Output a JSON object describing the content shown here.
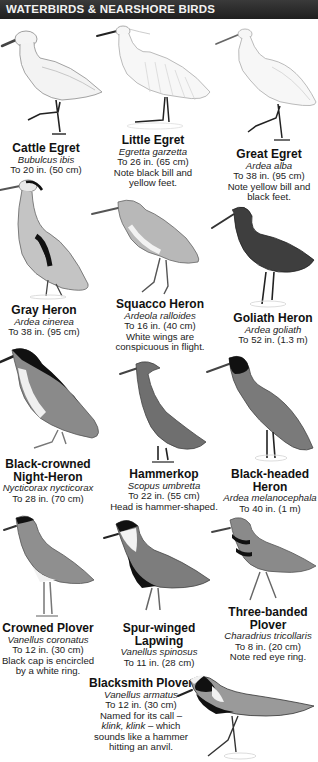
{
  "header": {
    "title": "WATERBIRDS & NEARSHORE BIRDS",
    "background": "#262626",
    "text_color": "#f2f2f2"
  },
  "birds": [
    {
      "common": "Cattle Egret",
      "scientific": "Bubulcus ibis",
      "size": "To 20 in. (50 cm)",
      "note": ""
    },
    {
      "common": "Little Egret",
      "scientific": "Egretta garzetta",
      "size": "To 26 in. (65 cm)",
      "note": "Note black bill and yellow feet."
    },
    {
      "common": "Great Egret",
      "scientific": "Ardea alba",
      "size": "To 38 in. (95 cm)",
      "note": "Note yellow bill and black feet."
    },
    {
      "common": "Gray Heron",
      "scientific": "Ardea cinerea",
      "size": "To 38 in. (95 cm)",
      "note": ""
    },
    {
      "common": "Squacco Heron",
      "scientific": "Ardeola ralloides",
      "size": "To 16 in. (40 cm)",
      "note": "White wings are conspicuous in flight."
    },
    {
      "common": "Goliath Heron",
      "scientific": "Ardea goliath",
      "size": "To 52 in. (1.3 m)",
      "note": ""
    },
    {
      "common": "Black-crowned Night-Heron",
      "scientific": "Nycticorax nycticorax",
      "size": "To 28 in. (70 cm)",
      "note": ""
    },
    {
      "common": "Hammerkop",
      "scientific": "Scopus umbretta",
      "size": "To 22 in. (55 cm)",
      "note": "Head is hammer-shaped."
    },
    {
      "common": "Black-headed Heron",
      "scientific": "Ardea melanocephala",
      "size": "To 40 in. (1 m)",
      "note": ""
    },
    {
      "common": "Crowned Plover",
      "scientific": "Vanellus coronatus",
      "size": "To 12 in. (30 cm)",
      "note": "Black cap is encircled by a white ring."
    },
    {
      "common": "Spur-winged Lapwing",
      "scientific": "Vanellus spinosus",
      "size": "To 11 in. (28 cm)",
      "note": ""
    },
    {
      "common": "Three-banded Plover",
      "scientific": "Charadrius tricollaris",
      "size": "To 8 in. (20 cm)",
      "note": "Note red eye ring."
    },
    {
      "common": "Blacksmith Plover",
      "scientific": "Vanellus armatus",
      "size": "To 12 in. (30 cm)",
      "note_before": "Named for its call – ",
      "note_call_1": "klink,",
      "note_call_2": "klink",
      "note_after": " – which sounds like a hammer hitting an anvil."
    }
  ],
  "illustrations": [
    {
      "icon": "cattle-egret-illustration"
    },
    {
      "icon": "little-egret-illustration"
    },
    {
      "icon": "great-egret-illustration"
    },
    {
      "icon": "gray-heron-illustration"
    },
    {
      "icon": "squacco-heron-illustration"
    },
    {
      "icon": "goliath-heron-illustration"
    },
    {
      "icon": "night-heron-illustration"
    },
    {
      "icon": "hammerkop-illustration"
    },
    {
      "icon": "black-headed-heron-illustration"
    },
    {
      "icon": "crowned-plover-illustration"
    },
    {
      "icon": "spur-winged-lapwing-illustration"
    },
    {
      "icon": "three-banded-plover-illustration"
    },
    {
      "icon": "blacksmith-plover-illustration"
    }
  ]
}
